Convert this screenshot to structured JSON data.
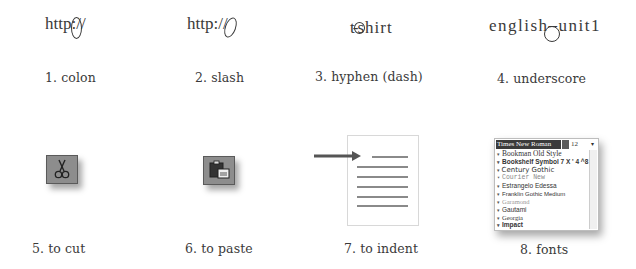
{
  "items": [
    {
      "number": "1.",
      "label": "1. colon",
      "sample": "http://",
      "sample_parts": [
        "http",
        ":",
        "//"
      ],
      "highlight": "colon"
    },
    {
      "number": "2.",
      "label": "2. slash",
      "sample": "http://",
      "sample_parts": [
        "http:",
        "//"
      ],
      "highlight": "slash"
    },
    {
      "number": "3.",
      "label": "3. hyphen (dash)",
      "sample": "t-shirt",
      "sample_parts": [
        "t",
        "-",
        "shirt"
      ],
      "highlight": "hyphen"
    },
    {
      "number": "4.",
      "label": "4. underscore",
      "sample": "english_unit1",
      "sample_parts": [
        "english",
        "_",
        "unit1"
      ],
      "highlight": "underscore"
    },
    {
      "number": "5.",
      "label": "5. to cut",
      "icon": "scissors-icon"
    },
    {
      "number": "6.",
      "label": "6. to paste",
      "icon": "clipboard-paste-icon"
    },
    {
      "number": "7.",
      "label": "7. to indent",
      "icon": "indent-page-icon"
    },
    {
      "number": "8.",
      "label": "8. fonts",
      "icon": "font-list-dropdown"
    }
  ],
  "font_dropdown": {
    "selected": "Times New Roman",
    "size": "12",
    "fonts": [
      "Bookman Old Style",
      "Bookshelf Symbol 7 X ' 4 ^8 !",
      "Century Gothic",
      "Courier New",
      "Estrangelo Edessa",
      "Franklin Gothic Medium",
      "Garamond",
      "Gautami",
      "Georgia",
      "Impact",
      "Latha"
    ]
  }
}
